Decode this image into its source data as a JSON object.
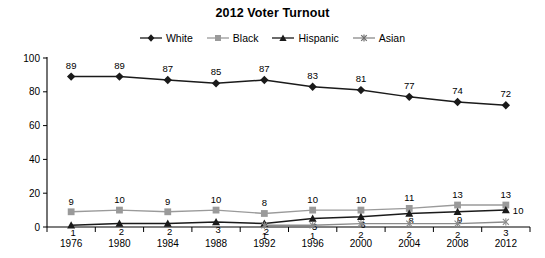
{
  "chart_data": {
    "type": "line",
    "title": "2012 Voter Turnout",
    "xlabel": "",
    "ylabel": "",
    "categories": [
      "1976",
      "1980",
      "1984",
      "1988",
      "1992",
      "1996",
      "2000",
      "2004",
      "2008",
      "2012"
    ],
    "ylim": [
      0,
      100
    ],
    "yticks": [
      0,
      20,
      40,
      60,
      80,
      100
    ],
    "grid": false,
    "legend_position": "top-center",
    "data_labels": true,
    "series": [
      {
        "name": "White",
        "marker": "diamond",
        "color": "#1a1a1a",
        "values": [
          89,
          89,
          87,
          85,
          87,
          83,
          81,
          77,
          74,
          72
        ],
        "labels": [
          "89",
          "89",
          "87",
          "85",
          "87",
          "83",
          "81",
          "77",
          "74",
          "72"
        ]
      },
      {
        "name": "Black",
        "marker": "square",
        "color": "#9a9a9a",
        "values": [
          9,
          10,
          9,
          10,
          8,
          10,
          10,
          11,
          13,
          13
        ],
        "labels": [
          "9",
          "10",
          "9",
          "10",
          "8",
          "10",
          "10",
          "11",
          "13",
          "13"
        ]
      },
      {
        "name": "Hispanic",
        "marker": "triangle",
        "color": "#1a1a1a",
        "values": [
          1,
          2,
          2,
          3,
          2,
          5,
          6,
          8,
          9,
          10
        ],
        "labels": [
          "1",
          "2",
          "2",
          "3",
          "2",
          "5",
          "6",
          "8",
          "9",
          "10"
        ]
      },
      {
        "name": "Asian",
        "marker": "star",
        "color": "#8a8a8a",
        "values": [
          null,
          null,
          null,
          null,
          1,
          1,
          2,
          2,
          2,
          3
        ],
        "labels": [
          "",
          "",
          "",
          "",
          "1",
          "1",
          "2",
          "2",
          "2",
          "3"
        ]
      }
    ]
  },
  "legend": {
    "items": [
      {
        "label": "White"
      },
      {
        "label": "Black"
      },
      {
        "label": "Hispanic"
      },
      {
        "label": "Asian"
      }
    ]
  },
  "axes": {
    "y_tick_labels": [
      "100",
      "80",
      "60",
      "40",
      "20",
      "0"
    ],
    "x_tick_labels": [
      "1976",
      "1980",
      "1984",
      "1988",
      "1992",
      "1996",
      "2000",
      "2004",
      "2008",
      "2012"
    ]
  }
}
